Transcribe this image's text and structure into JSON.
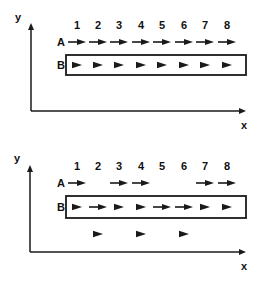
{
  "diagrams": [
    {
      "name": "top-panel",
      "axis_labels": {
        "y": "y",
        "x": "x"
      },
      "column_labels": [
        "1",
        "2",
        "3",
        "4",
        "5",
        "6",
        "7",
        "8"
      ],
      "row_labels": {
        "A": "A",
        "B": "B"
      },
      "row_a": [
        {
          "col": 1,
          "type": "long-arrow"
        },
        {
          "col": 2,
          "type": "long-arrow"
        },
        {
          "col": 3,
          "type": "long-arrow"
        },
        {
          "col": 4,
          "type": "long-arrow"
        },
        {
          "col": 5,
          "type": "long-arrow"
        },
        {
          "col": 6,
          "type": "long-arrow"
        },
        {
          "col": 7,
          "type": "long-arrow"
        },
        {
          "col": 8,
          "type": "long-arrow"
        }
      ],
      "row_b": [
        {
          "col": 1,
          "type": "head"
        },
        {
          "col": 2,
          "type": "head"
        },
        {
          "col": 3,
          "type": "head"
        },
        {
          "col": 4,
          "type": "head"
        },
        {
          "col": 5,
          "type": "head"
        },
        {
          "col": 6,
          "type": "head"
        },
        {
          "col": 7,
          "type": "head"
        },
        {
          "col": 8,
          "type": "head"
        }
      ],
      "below_b": []
    },
    {
      "name": "bottom-panel",
      "axis_labels": {
        "y": "y",
        "x": "x"
      },
      "column_labels": [
        "1",
        "2",
        "3",
        "4",
        "5",
        "6",
        "7",
        "8"
      ],
      "row_labels": {
        "A": "A",
        "B": "B"
      },
      "row_a": [
        {
          "col": 1,
          "type": "long-arrow"
        },
        {
          "col": 3,
          "type": "long-arrow"
        },
        {
          "col": 4,
          "type": "long-arrow"
        },
        {
          "col": 7,
          "type": "long-arrow"
        },
        {
          "col": 8,
          "type": "long-arrow"
        }
      ],
      "row_b": [
        {
          "col": 1,
          "type": "head"
        },
        {
          "col": 2,
          "type": "long-arrow"
        },
        {
          "col": 3,
          "type": "head"
        },
        {
          "col": 4,
          "type": "head"
        },
        {
          "col": 5,
          "type": "long-arrow"
        },
        {
          "col": 6,
          "type": "long-arrow"
        },
        {
          "col": 7,
          "type": "head"
        },
        {
          "col": 8,
          "type": "head"
        }
      ],
      "below_b": [
        {
          "col": 2,
          "type": "head"
        },
        {
          "col": 4,
          "type": "head"
        },
        {
          "col": 6,
          "type": "head"
        }
      ]
    }
  ]
}
